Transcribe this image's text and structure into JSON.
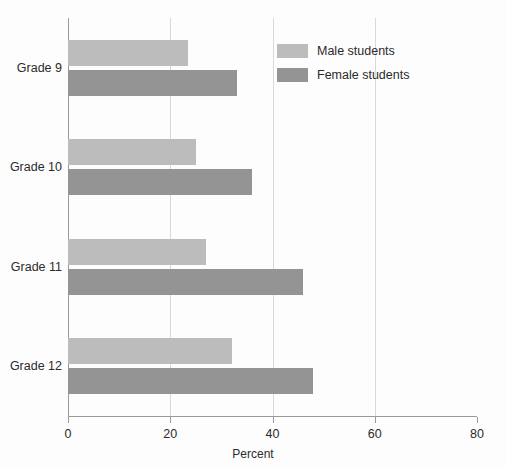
{
  "chart_data": {
    "type": "bar",
    "orientation": "horizontal",
    "title": "",
    "xlabel": "Percent",
    "ylabel": "",
    "xlim": [
      0,
      80
    ],
    "xticks": [
      0,
      20,
      40,
      60,
      80
    ],
    "xtick_labels": [
      "0",
      "20",
      "40",
      "60",
      "80"
    ],
    "grid": "vertical",
    "legend_position": "top-center-right",
    "categories": [
      "Grade 9",
      "Grade 10",
      "Grade 11",
      "Grade 12"
    ],
    "series": [
      {
        "name": "Male students",
        "color": "#bcbcbc",
        "values": [
          23.5,
          25,
          27,
          32
        ]
      },
      {
        "name": "Female students",
        "color": "#949494",
        "values": [
          33,
          36,
          46,
          48
        ]
      }
    ]
  },
  "legend": {
    "items": [
      {
        "label": "Male students",
        "swatch": "male"
      },
      {
        "label": "Female students",
        "swatch": "female"
      }
    ]
  },
  "axis": {
    "x_title": "Percent"
  }
}
